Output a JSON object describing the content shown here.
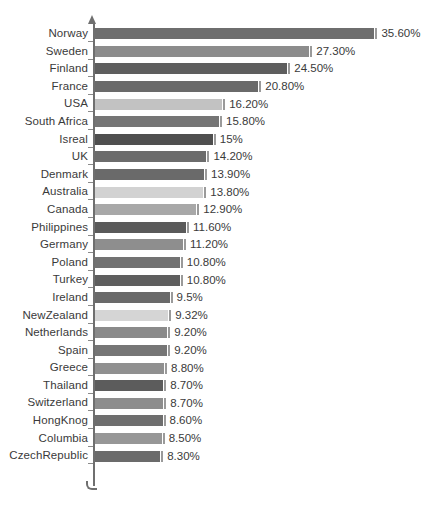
{
  "chart_data": {
    "type": "bar",
    "orientation": "horizontal",
    "title": "",
    "subtitle": "",
    "xlabel": "",
    "ylabel": "",
    "xlim": [
      0,
      35.6
    ],
    "grid": false,
    "legend": null,
    "value_suffix": "%",
    "categories": [
      "Norway",
      "Sweden",
      "Finland",
      "France",
      "USA",
      "South Africa",
      "Isreal",
      "UK",
      "Denmark",
      "Australia",
      "Canada",
      "Philippines",
      "Germany",
      "Poland",
      "Turkey",
      "Ireland",
      "NewZealand",
      "Netherlands",
      "Spain",
      "Greece",
      "Thailand",
      "Switzerland",
      "HongKnog",
      "Columbia",
      "CzechRepublic"
    ],
    "values": [
      35.6,
      27.3,
      24.5,
      20.8,
      16.2,
      15.8,
      15.0,
      14.2,
      13.9,
      13.8,
      12.9,
      11.6,
      11.2,
      10.8,
      10.8,
      9.5,
      9.32,
      9.2,
      9.2,
      8.8,
      8.7,
      8.7,
      8.6,
      8.5,
      8.3
    ],
    "value_labels": [
      "35.60%",
      "27.30%",
      "24.50%",
      "20.80%",
      "16.20%",
      "15.80%",
      "15%",
      "14.20%",
      "13.90%",
      "13.80%",
      "12.90%",
      "11.60%",
      "11.20%",
      "10.80%",
      "10.80%",
      "9.5%",
      "9.32%",
      "9.20%",
      "9.20%",
      "8.80%",
      "8.70%",
      "8.70%",
      "8.60%",
      "8.50%",
      "8.30%"
    ],
    "bar_colors": [
      "#6e6e6e",
      "#8c8c8c",
      "#5e5e5e",
      "#6a6a6a",
      "#c2c2c2",
      "#757575",
      "#4f4f4f",
      "#6c6c6c",
      "#6a6a6a",
      "#d2d2d2",
      "#a8a8a8",
      "#5a5a5a",
      "#8e8e8e",
      "#727272",
      "#5e5e5e",
      "#6a6a6a",
      "#d5d5d5",
      "#8a8a8a",
      "#767676",
      "#909090",
      "#5c5c5c",
      "#8d8d8d",
      "#6e6e6e",
      "#979797",
      "#6b6b6b"
    ],
    "axis_color": "#6f6f6f",
    "text_color": "#3a3a3a",
    "background_color": "#ffffff",
    "px_per_unit": 7.85
  }
}
